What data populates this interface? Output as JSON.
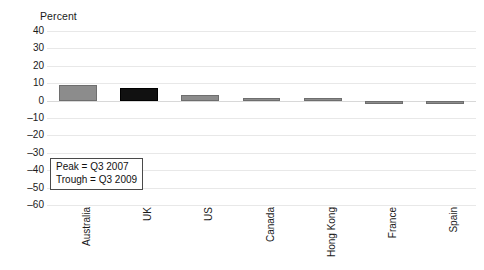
{
  "chart_data": {
    "type": "bar",
    "title": "",
    "ylabel": "Percent",
    "xlabel": "",
    "categories": [
      "Australia",
      "UK",
      "US",
      "Canada",
      "Hong Kong",
      "France",
      "Spain"
    ],
    "values": [
      9,
      7.5,
      3,
      1.5,
      1.5,
      -0.5,
      -1.5
    ],
    "bar_colors": [
      "#8c8c8c",
      "#111111",
      "#8c8c8c",
      "#8c8c8c",
      "#8c8c8c",
      "#8c8c8c",
      "#8c8c8c"
    ],
    "ylim": [
      -60,
      40
    ],
    "yticks": [
      40,
      30,
      20,
      10,
      0,
      -10,
      -20,
      -30,
      -40,
      -50,
      -60
    ],
    "ytick_labels": [
      "40",
      "30",
      "20",
      "10",
      "0",
      "–10",
      "–20",
      "–30",
      "–40",
      "–50",
      "–60"
    ],
    "grid": true,
    "legend": "none",
    "annotations": {
      "peak": "Peak = Q3 2007",
      "trough": "Trough = Q3 2009"
    }
  }
}
